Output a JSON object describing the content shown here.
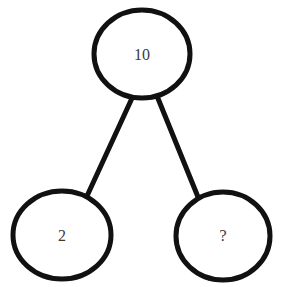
{
  "diagram": {
    "type": "number-bond",
    "background_color": "#ffffff",
    "stroke_color": "#111111",
    "node_fill_color": "#ffffff",
    "label_color": "#3a3a3a",
    "stroke_width": 5,
    "nodes": [
      {
        "id": "whole",
        "role": "whole",
        "label": "10",
        "cx": 142,
        "cy": 54,
        "rx": 48,
        "ry": 44,
        "label_x": 142,
        "label_y": 56
      },
      {
        "id": "part-left",
        "role": "part",
        "label": "2",
        "cx": 62,
        "cy": 235,
        "rx": 49,
        "ry": 44,
        "label_x": 62,
        "label_y": 237
      },
      {
        "id": "part-right",
        "role": "part-unknown",
        "label": "?",
        "cx": 223,
        "cy": 236,
        "rx": 47,
        "ry": 44,
        "label_x": 223,
        "label_y": 237
      }
    ],
    "edges": [
      {
        "id": "edge-whole-to-left",
        "from": "whole",
        "to": "part-left",
        "x1": 133,
        "y1": 96,
        "x2": 87,
        "y2": 196
      },
      {
        "id": "edge-whole-to-right",
        "from": "whole",
        "to": "part-right",
        "x1": 157,
        "y1": 96,
        "x2": 198,
        "y2": 197
      }
    ]
  }
}
